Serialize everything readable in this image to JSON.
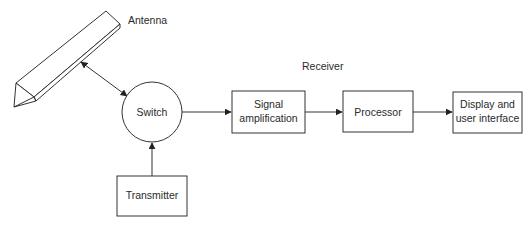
{
  "diagram": {
    "labels": {
      "antenna": "Antenna",
      "receiver": "Receiver"
    },
    "nodes": {
      "switch": "Switch",
      "transmitter": "Transmitter",
      "signal_amplification": [
        "Signal",
        "amplification"
      ],
      "processor": "Processor",
      "display": [
        "Display and",
        "user interface"
      ]
    },
    "edges": [
      {
        "from": "antenna",
        "to": "switch",
        "type": "bidirectional"
      },
      {
        "from": "transmitter",
        "to": "switch",
        "type": "directed"
      },
      {
        "from": "switch",
        "to": "signal_amplification",
        "type": "directed"
      },
      {
        "from": "signal_amplification",
        "to": "processor",
        "type": "directed"
      },
      {
        "from": "processor",
        "to": "display",
        "type": "directed"
      }
    ],
    "colors": {
      "stroke": "#333333",
      "text": "#2a2a2a",
      "background": "#ffffff"
    }
  }
}
